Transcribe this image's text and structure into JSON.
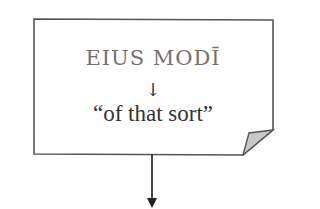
{
  "diagram": {
    "box": {
      "headword": "EIUS MODĪ",
      "inner_arrow": "↓",
      "translation": "“of that sort”"
    },
    "colors": {
      "border": "#555555",
      "headword_text": "#707070",
      "body_text": "#333333",
      "fold_fill": "#c8c8c8"
    }
  }
}
